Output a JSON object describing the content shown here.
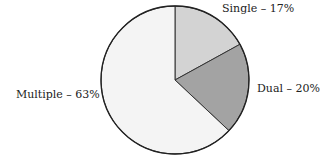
{
  "chart_data": {
    "type": "pie",
    "title": "",
    "slices": [
      {
        "label": "Single",
        "value": 17,
        "color": "#d3d3d3",
        "text": "Single – 17%"
      },
      {
        "label": "Dual",
        "value": 20,
        "color": "#a3a3a3",
        "text": "Dual – 20%"
      },
      {
        "label": "Multiple",
        "value": 63,
        "color": "#f4f4f4",
        "text": "Multiple – 63%"
      }
    ],
    "start_angle_deg": 0,
    "direction": "clockwise",
    "legend": "none (direct labels)"
  }
}
